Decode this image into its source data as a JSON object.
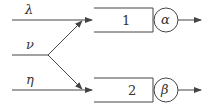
{
  "diagram": {
    "inputs": [
      {
        "symbol": "λ",
        "y": 20
      },
      {
        "symbol": "ν",
        "y": 55
      },
      {
        "symbol": "η",
        "y": 90
      }
    ],
    "blocks": [
      {
        "label": "1",
        "gain": "α"
      },
      {
        "label": "2",
        "gain": "β"
      }
    ],
    "colors": {
      "stroke": "#444444",
      "background": "#ffffff"
    }
  }
}
